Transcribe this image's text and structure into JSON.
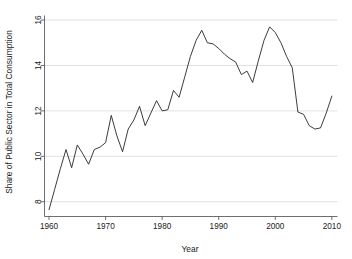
{
  "chart_data": {
    "type": "line",
    "title": "",
    "xlabel": "Year",
    "ylabel": "Share of Public Sector in Total Consumption",
    "xlim": [
      1959.2,
      2011.0
    ],
    "ylim": [
      7.35,
      16.2
    ],
    "xticks": [
      1960,
      1970,
      1980,
      1990,
      2000,
      2010
    ],
    "yticks": [
      8,
      10,
      12,
      14,
      16
    ],
    "xtick_labels": [
      "1960",
      "1970",
      "1980",
      "1990",
      "2000",
      "2010"
    ],
    "ytick_labels": [
      "8",
      "10",
      "12",
      "14",
      "16"
    ],
    "grid": "horizontal",
    "legend": "none",
    "line_color": "#262626",
    "x": [
      1960,
      1961,
      1962,
      1963,
      1964,
      1965,
      1966,
      1967,
      1968,
      1969,
      1970,
      1971,
      1972,
      1973,
      1974,
      1975,
      1976,
      1977,
      1978,
      1979,
      1980,
      1981,
      1982,
      1983,
      1984,
      1985,
      1986,
      1987,
      1988,
      1989,
      1990,
      1991,
      1992,
      1993,
      1994,
      1995,
      1996,
      1997,
      1998,
      1999,
      2000,
      2001,
      2002,
      2003,
      2004,
      2005,
      2006,
      2007,
      2008,
      2009,
      2010
    ],
    "values": [
      7.65,
      8.55,
      9.45,
      10.3,
      9.5,
      10.5,
      10.1,
      9.65,
      10.3,
      10.4,
      10.6,
      11.8,
      10.9,
      10.2,
      11.2,
      11.6,
      12.2,
      11.35,
      11.9,
      12.45,
      12.0,
      12.05,
      12.9,
      12.6,
      13.5,
      14.4,
      15.1,
      15.55,
      15.0,
      14.95,
      14.75,
      14.5,
      14.3,
      14.15,
      13.6,
      13.75,
      13.25,
      14.2,
      15.1,
      15.7,
      15.45,
      15.0,
      14.4,
      13.9,
      11.95,
      11.85,
      11.35,
      11.2,
      11.25,
      11.9,
      12.65
    ]
  }
}
